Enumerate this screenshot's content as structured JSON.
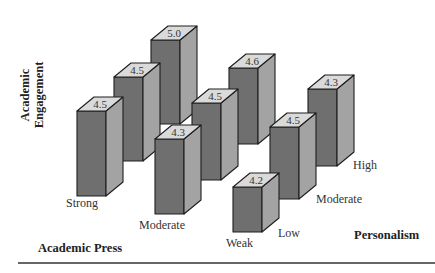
{
  "chart_data": {
    "type": "bar",
    "subtype": "3d-bar-grid",
    "title": "",
    "ylabel": "Academic Engagement",
    "x_axis_label": "Academic Press",
    "z_axis_label": "Personalism",
    "x_categories": [
      "Strong",
      "Moderate",
      "Weak"
    ],
    "z_categories": [
      "Low",
      "Moderate",
      "High"
    ],
    "series": [
      {
        "name": "Strong",
        "values": [
          4.5,
          4.5,
          5.0
        ]
      },
      {
        "name": "Moderate",
        "values": [
          4.3,
          4.5,
          4.6
        ]
      },
      {
        "name": "Weak",
        "values": [
          4.2,
          4.5,
          4.3
        ]
      }
    ],
    "grid": false,
    "legend": false
  },
  "colors": {
    "front": "#6f6f6f",
    "side": "#a3a3a3",
    "top": "#dadada",
    "stroke": "#1e1e1e",
    "rule": "#666666"
  },
  "bars": [
    {
      "press": "Strong",
      "personalism": "Low",
      "label": "4.5",
      "x": 77,
      "bottom": 196,
      "top": 111
    },
    {
      "press": "Strong",
      "personalism": "Moderate",
      "label": "4.5",
      "x": 114,
      "bottom": 161,
      "top": 77
    },
    {
      "press": "Strong",
      "personalism": "High",
      "label": "5.0",
      "x": 151,
      "bottom": 124,
      "top": 40
    },
    {
      "press": "Moderate",
      "personalism": "Low",
      "label": "4.3",
      "x": 155,
      "bottom": 214,
      "top": 139
    },
    {
      "press": "Moderate",
      "personalism": "Moderate",
      "label": "4.5",
      "x": 192,
      "bottom": 180,
      "top": 103
    },
    {
      "press": "Moderate",
      "personalism": "High",
      "label": "4.6",
      "x": 229,
      "bottom": 144,
      "top": 68
    },
    {
      "press": "Weak",
      "personalism": "Low",
      "label": "4.2",
      "x": 233,
      "bottom": 232,
      "top": 187
    },
    {
      "press": "Weak",
      "personalism": "Moderate",
      "label": "4.5",
      "x": 270,
      "bottom": 199,
      "top": 127
    },
    {
      "press": "Weak",
      "personalism": "High",
      "label": "4.3",
      "x": 308,
      "bottom": 166,
      "top": 89
    }
  ],
  "labels": {
    "y_axis": [
      "Academic",
      "Engagement"
    ],
    "x_axis_title": "Academic Press",
    "z_axis_title": "Personalism",
    "press_ticks": [
      {
        "text": "Strong",
        "x": 66,
        "y": 207
      },
      {
        "text": "Moderate",
        "x": 139,
        "y": 229
      },
      {
        "text": "Weak",
        "x": 226,
        "y": 247
      }
    ],
    "personalism_ticks": [
      {
        "text": "Low",
        "x": 278,
        "y": 237
      },
      {
        "text": "Moderate",
        "x": 316,
        "y": 203
      },
      {
        "text": "High",
        "x": 353,
        "y": 169
      }
    ]
  }
}
